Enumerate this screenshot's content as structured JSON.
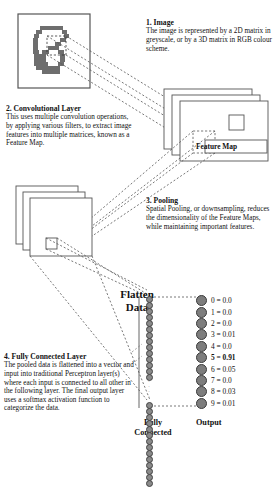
{
  "diagram": {
    "sections": [
      {
        "id": "image",
        "heading": "1. Image",
        "body": "The image is represented by a 2D matrix in greyscale, or by a 3D matrix in RGB colour scheme."
      },
      {
        "id": "convolutional_layer",
        "heading": "2. Convolutional Layer",
        "body": "This uses multiple convolution operations, by applying various filters, to extract image features into multiple matrices, known as a Feature Map."
      },
      {
        "id": "pooling",
        "heading": "3. Pooling",
        "body": "Spatial Pooling, or downsampling, reduces the dimensionality of the Feature Maps, while maintaining important features."
      },
      {
        "id": "fully_connected_layer",
        "heading": "4. Fully Connected Layer",
        "body": "The pooled data is flattened into a vector and input into traditional Perceptron layer(s) where each input is connected to all other in the following layer. The final output layer uses a softmax activation function to categorize the data."
      }
    ],
    "labels": {
      "feature_map": "Feature Map",
      "flatten_data": "Flatten\nData",
      "flatten_data_line1": "Flatten",
      "flatten_data_line2": "Data",
      "fully_connected_line1": "Fully",
      "fully_connected_line2": "Connected",
      "output": "Output"
    },
    "input_image": {
      "name": "handwritten-digit-five",
      "description": "Pixelated greyscale handwritten digit 5"
    },
    "output_nodes": [
      {
        "label": "0 = 0.0",
        "class": "0",
        "value": 0.0,
        "highlighted": false
      },
      {
        "label": "1 = 0.0",
        "class": "1",
        "value": 0.0,
        "highlighted": false
      },
      {
        "label": "2 = 0.0",
        "class": "2",
        "value": 0.0,
        "highlighted": false
      },
      {
        "label": "3 = 0.01",
        "class": "3",
        "value": 0.01,
        "highlighted": false
      },
      {
        "label": "4 = 0.0",
        "class": "4",
        "value": 0.0,
        "highlighted": false
      },
      {
        "label": "5 = 0.91",
        "class": "5",
        "value": 0.91,
        "highlighted": true
      },
      {
        "label": "6 = 0.05",
        "class": "6",
        "value": 0.05,
        "highlighted": false
      },
      {
        "label": "7 = 0.0",
        "class": "7",
        "value": 0.0,
        "highlighted": false
      },
      {
        "label": "8 = 0.03",
        "class": "8",
        "value": 0.03,
        "highlighted": false
      },
      {
        "label": "9 = 0.01",
        "class": "9",
        "value": 0.01,
        "highlighted": false
      }
    ],
    "colors": {
      "node_fill": "#7d7d7d",
      "node_stroke": "#3a3a3a",
      "line": "#555555",
      "text": "#111111",
      "digit_ink": "#6e6e6e",
      "box_stroke": "#555555"
    }
  }
}
